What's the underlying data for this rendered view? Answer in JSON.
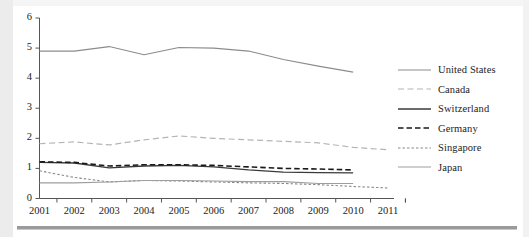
{
  "chart_data": {
    "type": "line",
    "title": "",
    "subtitle": "",
    "xlabel": "",
    "ylabel": "",
    "xlim": [
      2001,
      2011
    ],
    "ylim": [
      0,
      6
    ],
    "yticks": [
      "0",
      "1",
      "2",
      "3",
      "4",
      "5",
      "6"
    ],
    "grid": false,
    "legend_position": "right",
    "categories": [
      2001,
      2002,
      2003,
      2004,
      2005,
      2006,
      2007,
      2008,
      2009,
      2010,
      2011
    ],
    "series": [
      {
        "name": "United States",
        "color": "#8c8c8c",
        "style": "solid",
        "width": 1.1,
        "values": [
          4.9,
          4.9,
          5.05,
          4.78,
          5.02,
          5.0,
          4.9,
          4.62,
          4.4,
          4.2,
          null
        ]
      },
      {
        "name": "Canada",
        "color": "#b4b4b4",
        "style": "dashed",
        "width": 1.2,
        "values": [
          1.82,
          1.88,
          1.78,
          1.95,
          2.08,
          2.0,
          1.95,
          1.9,
          1.85,
          1.7,
          1.62
        ]
      },
      {
        "name": "Switzerland",
        "color": "#3a3a3a",
        "style": "solid",
        "width": 1.3,
        "values": [
          1.2,
          1.18,
          1.02,
          1.08,
          1.1,
          1.05,
          0.95,
          0.88,
          0.86,
          0.85,
          null
        ]
      },
      {
        "name": "Germany",
        "color": "#1a1a1a",
        "style": "bold-dashed",
        "width": 1.6,
        "values": [
          1.22,
          1.2,
          1.08,
          1.12,
          1.12,
          1.1,
          1.05,
          1.0,
          0.98,
          0.95,
          null
        ]
      },
      {
        "name": "Singapore",
        "color": "#8a8a8a",
        "style": "dotted",
        "width": 1.1,
        "values": [
          0.92,
          0.7,
          0.55,
          0.6,
          0.58,
          0.55,
          0.52,
          0.5,
          0.46,
          0.4,
          0.35
        ]
      },
      {
        "name": "Japan",
        "color": "#9e9e9e",
        "style": "solid",
        "width": 1.1,
        "values": [
          0.52,
          0.52,
          0.55,
          0.6,
          0.6,
          0.58,
          0.56,
          0.56,
          0.5,
          0.5,
          null
        ]
      }
    ]
  },
  "legend": {
    "items": [
      {
        "label": "United States"
      },
      {
        "label": "Canada"
      },
      {
        "label": "Switzerland"
      },
      {
        "label": "Germany"
      },
      {
        "label": "Singapore"
      },
      {
        "label": "Japan"
      }
    ]
  }
}
